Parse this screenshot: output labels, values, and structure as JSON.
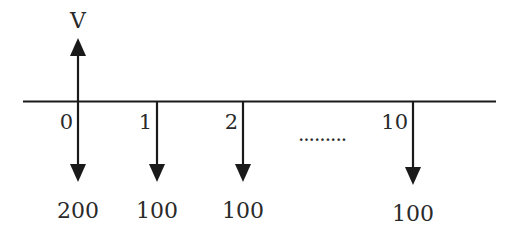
{
  "diagram": {
    "type": "cash-flow-timeline",
    "colors": {
      "line": "#1a1a1a",
      "text": "#2a2a2a",
      "background": "#ffffff"
    },
    "inflow": {
      "period": "0",
      "label": "V",
      "direction": "up"
    },
    "periods": [
      {
        "period": "0",
        "amount": "200",
        "direction": "down"
      },
      {
        "period": "1",
        "amount": "100",
        "direction": "down"
      },
      {
        "period": "2",
        "amount": "100",
        "direction": "down"
      },
      {
        "period": "10",
        "amount": "100",
        "direction": "down"
      }
    ],
    "ellipsis": "........."
  }
}
